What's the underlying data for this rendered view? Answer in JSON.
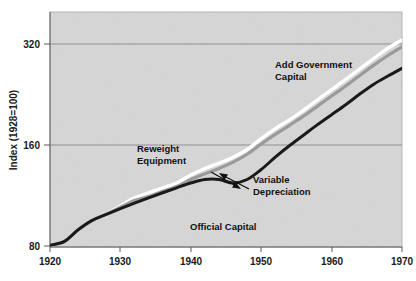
{
  "chart_data": {
    "type": "line",
    "title": "",
    "xlabel": "",
    "ylabel": "Index (1928=100)",
    "scale": "log",
    "grid": true,
    "legend_position": "inline-annotations",
    "xlim": [
      1920,
      1970
    ],
    "ylim": [
      80,
      400
    ],
    "xticks": [
      1920,
      1930,
      1940,
      1950,
      1960,
      1970
    ],
    "yticks": [
      80,
      160,
      320
    ],
    "x": [
      1920,
      1922,
      1924,
      1926,
      1928,
      1930,
      1932,
      1934,
      1936,
      1938,
      1940,
      1942,
      1944,
      1946,
      1948,
      1950,
      1952,
      1954,
      1956,
      1958,
      1960,
      1962,
      1964,
      1966,
      1968,
      1970
    ],
    "series": [
      {
        "name": "Add Government Capital",
        "color": "#ffffff",
        "values": [
          81,
          83,
          90,
          96,
          100,
          106,
          112,
          116,
          120,
          124,
          131,
          137,
          142,
          148,
          156,
          168,
          180,
          191,
          204,
          219,
          235,
          252,
          271,
          291,
          312,
          330
        ]
      },
      {
        "name": "Reweight Equipment",
        "color": "#9a9a9a",
        "values": [
          81,
          83,
          90,
          96,
          100,
          105,
          110,
          113,
          117,
          121,
          127,
          132,
          137,
          143,
          151,
          162,
          173,
          184,
          196,
          210,
          225,
          241,
          259,
          278,
          297,
          315
        ]
      },
      {
        "name": "Variable Depreciation",
        "color": "#1a1a1a",
        "values": [
          81,
          83,
          90,
          96,
          100,
          104,
          108,
          112,
          116,
          120,
          124,
          127,
          127,
          124,
          127,
          136,
          148,
          160,
          172,
          185,
          198,
          212,
          228,
          244,
          258,
          272
        ]
      }
    ],
    "annotations": [
      {
        "name": "add-government-capital",
        "text_lines": [
          "Add Government",
          "Capital"
        ],
        "x": 275,
        "y": 68,
        "arrow": false
      },
      {
        "name": "reweight-equipment",
        "text_lines": [
          "Reweight",
          "Equipment"
        ],
        "x": 137,
        "y": 152,
        "arrow": true,
        "arrow_from": [
          211,
          172
        ],
        "arrow_to": [
          241,
          189
        ]
      },
      {
        "name": "variable-depreciation",
        "text_lines": [
          "Variable",
          "Depreciation"
        ],
        "x": 253,
        "y": 183,
        "arrow": true,
        "arrow_from": [
          249,
          189
        ],
        "arrow_to": [
          219,
          173
        ]
      },
      {
        "name": "official-capital",
        "text_lines": [
          "Official Capital"
        ],
        "x": 190,
        "y": 230,
        "arrow": false
      }
    ]
  },
  "colors": {
    "plot_background": "#d6d6d6",
    "page_background": "#ffffff",
    "gridline": "#8f8f8f",
    "axis_text": "#1a1a1a",
    "line_white": "#ffffff",
    "line_gray": "#9a9a9a",
    "line_black": "#1a1a1a"
  }
}
